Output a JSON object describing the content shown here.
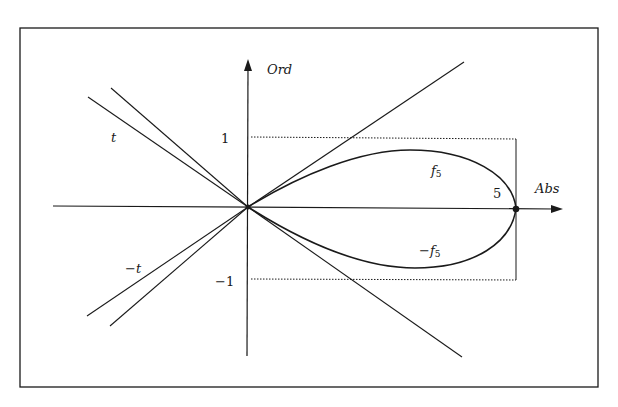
{
  "diagram": {
    "axes": {
      "x_label": "Abs",
      "y_label": "Ord"
    },
    "ticks": {
      "y_pos": "1",
      "y_neg": "−1",
      "x_end": "5"
    },
    "curves": {
      "upper": {
        "name": "f",
        "sub": "5"
      },
      "lower": {
        "prefix": "−",
        "name": "f",
        "sub": "5"
      }
    },
    "tangents": {
      "upper": "t",
      "lower": "−t"
    },
    "colors": {
      "ink": "#1a1a1a",
      "background": "#ffffff"
    }
  }
}
